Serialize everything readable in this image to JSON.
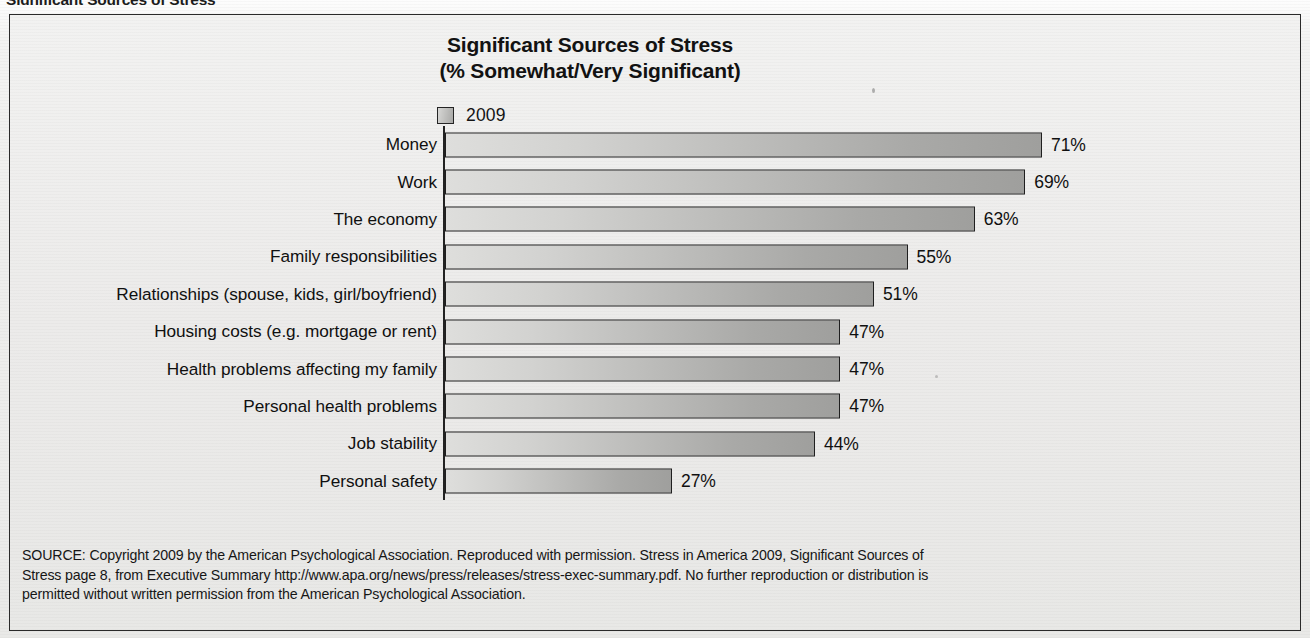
{
  "page_header": "Significant Sources of Stress",
  "chart_title": {
    "line1": "Significant Sources of Stress",
    "line2": "(% Somewhat/Very Significant)"
  },
  "legend": {
    "series_label": "2009",
    "swatch_name": "legend-swatch-2009"
  },
  "source_note": {
    "line1": "SOURCE: Copyright 2009 by the American Psychological Association.  Reproduced with permission. Stress in America 2009, Significant Sources of",
    "line2": "Stress page 8, from Executive Summary http://www.apa.org/news/press/releases/stress-exec-summary.pdf. No further reproduction or distribution is",
    "line3": "permitted without written permission from the American Psychological Association."
  },
  "colors": {
    "bar_light": "#dededc",
    "bar_dark": "#9f9f9d",
    "bar_outline": "#1f1f1f",
    "frame_border": "#2a2a2a",
    "paper": "#ecebea",
    "text": "#101010"
  },
  "chart_data": {
    "type": "bar",
    "orientation": "horizontal",
    "title": "Significant Sources of Stress (% Somewhat/Very Significant)",
    "xlabel": "",
    "ylabel": "",
    "xlim": [
      0,
      100
    ],
    "grid": false,
    "legend_position": "top-left",
    "series": [
      {
        "name": "2009",
        "values": [
          71,
          69,
          63,
          55,
          51,
          47,
          47,
          47,
          44,
          27
        ]
      }
    ],
    "categories": [
      "Money",
      "Work",
      "The economy",
      "Family responsibilities",
      "Relationships (spouse, kids, girl/boyfriend)",
      "Housing costs (e.g. mortgage or rent)",
      "Health problems affecting my family",
      "Personal health problems",
      "Job stability",
      "Personal safety"
    ],
    "value_labels": [
      "71%",
      "69%",
      "63%",
      "55%",
      "51%",
      "47%",
      "47%",
      "47%",
      "44%",
      "27%"
    ]
  }
}
